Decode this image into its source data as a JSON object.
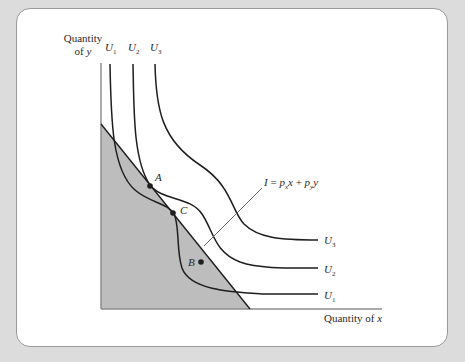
{
  "figure": {
    "y_axis_label_line1": "Quantity",
    "y_axis_label_line2_prefix": "of ",
    "y_axis_label_var": "y",
    "x_axis_label_prefix": "Quantity of ",
    "x_axis_label_var": "x",
    "budget_line_label": {
      "I": "I",
      "eq": " = ",
      "p": "p",
      "sub_x": "x",
      "x": "x",
      "plus": " + ",
      "sub_y": "y",
      "y": "y"
    },
    "curves": [
      {
        "name": "U",
        "sub": "1"
      },
      {
        "name": "U",
        "sub": "2"
      },
      {
        "name": "U",
        "sub": "3"
      }
    ],
    "points": [
      {
        "label": "A"
      },
      {
        "label": "C"
      },
      {
        "label": "B"
      }
    ],
    "colors": {
      "background": "#dcdcdc",
      "panel": "#ffffff",
      "budget_set_fill": "#bdbdbd",
      "curve_stroke": "#1e1e1e",
      "axis_stroke": "#8c8c8c"
    }
  }
}
